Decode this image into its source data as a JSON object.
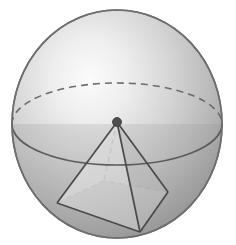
{
  "figure": {
    "title": "Sphere with inscribed square pyramid",
    "domain_kind": "geometry-diagram",
    "canvas": {
      "width": 236,
      "height": 245,
      "background": "#ffffff"
    },
    "colors": {
      "sphere_highlight": "#f2f2f2",
      "sphere_mid": "#c9c9c9",
      "sphere_shadow": "#8f8f8f",
      "sphere_outline": "#6e6e6e",
      "equator_line": "#595959",
      "equator_dashed": "#6b6b6b",
      "pyramid_edge": "#4a4a4a",
      "pyramid_hidden_edge": "#7a7a7a",
      "face_left": "#d8d8d8",
      "face_right": "#b8b8b8",
      "face_base": "#bdbdbd",
      "apex_dot": "#4a4a4a"
    },
    "sphere": {
      "label": "sphere",
      "center_x": 117,
      "center_y": 124,
      "radius_x": 105,
      "radius_y": 114,
      "highlight_x": 56,
      "highlight_y": 64,
      "outline_width": 1.6
    },
    "equator": {
      "label": "equator-ellipse",
      "center_x": 117,
      "center_y": 124,
      "radius_x": 105,
      "radius_y": 41,
      "front_style": "solid",
      "back_style": "dashed",
      "dash_pattern": "7,5"
    },
    "pyramid": {
      "label": "inscribed-square-pyramid",
      "apex": {
        "name": "apex",
        "x": 117,
        "y": 122,
        "dot_radius": 4.5
      },
      "base_vertices": [
        {
          "name": "base-vertex-left",
          "x": 57,
          "y": 203,
          "hidden": false
        },
        {
          "name": "base-vertex-front",
          "x": 140,
          "y": 232,
          "hidden": false
        },
        {
          "name": "base-vertex-right",
          "x": 168,
          "y": 192,
          "hidden": false
        },
        {
          "name": "base-vertex-back",
          "x": 104,
          "y": 181,
          "hidden": true
        }
      ],
      "edges": [
        {
          "from": "apex",
          "to": "base-vertex-left",
          "hidden": false
        },
        {
          "from": "apex",
          "to": "base-vertex-front",
          "hidden": false
        },
        {
          "from": "apex",
          "to": "base-vertex-right",
          "hidden": false
        },
        {
          "from": "apex",
          "to": "base-vertex-back",
          "hidden": true
        }
      ],
      "base_edges": [
        {
          "from": "base-vertex-left",
          "to": "base-vertex-front",
          "hidden": false
        },
        {
          "from": "base-vertex-front",
          "to": "base-vertex-right",
          "hidden": false
        },
        {
          "from": "base-vertex-right",
          "to": "base-vertex-back",
          "hidden": true
        },
        {
          "from": "base-vertex-back",
          "to": "base-vertex-left",
          "hidden": true
        }
      ]
    }
  }
}
